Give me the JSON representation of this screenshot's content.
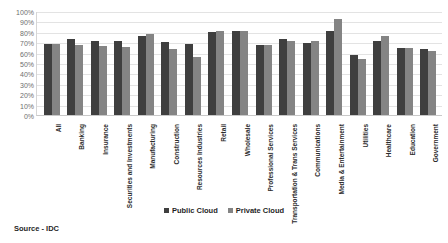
{
  "chart_data": {
    "type": "bar",
    "title": "",
    "xlabel": "",
    "ylabel": "",
    "ylim": [
      0,
      100
    ],
    "ytick_labels": [
      "100%",
      "90%",
      "80%",
      "70%",
      "60%",
      "50%",
      "40%",
      "30%",
      "20%",
      "10%",
      "0%"
    ],
    "ytick_values": [
      100,
      90,
      80,
      70,
      60,
      50,
      40,
      30,
      20,
      10,
      0
    ],
    "grid": true,
    "legend_position": "bottom",
    "categories": [
      "All",
      "Banking",
      "Insurance",
      "Securities and Investments",
      "Manufacturing",
      "Construction",
      "Resources Industries",
      "Retail",
      "Wholesale",
      "Professional Services",
      "Transportation & Trans Services",
      "Communications",
      "Media & Entertainment",
      "Utilities",
      "Healthcare",
      "Education",
      "Government"
    ],
    "series": [
      {
        "name": "Public Cloud",
        "color": "#3f3f3f",
        "values": [
          68,
          73,
          71,
          71,
          76,
          70,
          68,
          80,
          81,
          67,
          73,
          69,
          81,
          58,
          71,
          64,
          63
        ]
      },
      {
        "name": "Private Cloud",
        "color": "#848484",
        "values": [
          68,
          67,
          66,
          65,
          78,
          63,
          56,
          81,
          81,
          67,
          71,
          71,
          92,
          54,
          76,
          64,
          62
        ]
      }
    ]
  },
  "legend": {
    "items": [
      {
        "label": "Public Cloud"
      },
      {
        "label": "Private Cloud"
      }
    ]
  },
  "footer": {
    "source": "Source - IDC"
  },
  "colors": {
    "public_cloud": "#3f3f3f",
    "private_cloud": "#848484",
    "gridline": "#e3e3e3",
    "axis": "#c9c9c9",
    "background": "#ffffff"
  }
}
